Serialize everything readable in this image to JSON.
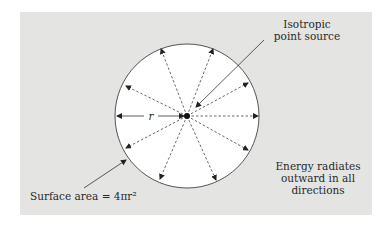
{
  "diagram": {
    "type": "isotropic-point-source-radiation",
    "labels": {
      "source": [
        "Isotropic",
        "point source"
      ],
      "radius": "r",
      "surface_area": "Surface area = 4πr²",
      "energy": [
        "Energy radiates",
        "outward in all",
        "directions"
      ]
    },
    "colors": {
      "panel": "#e4e4e2",
      "circle_fill": "#ffffff",
      "stroke": "#333333"
    },
    "geometry": {
      "center": [
        187,
        116
      ],
      "radius": 72,
      "arrow_count": 10
    }
  }
}
